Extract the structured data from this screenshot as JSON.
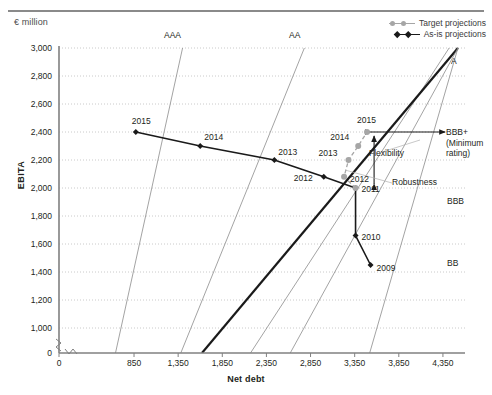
{
  "header": {
    "unit_label": "€ million"
  },
  "legend": {
    "position": "top-right",
    "entries": [
      {
        "label": "Target projections",
        "color": "#a6a6a6",
        "marker": "circle"
      },
      {
        "label": "As-is projections",
        "color": "#1a1a1a",
        "marker": "diamond"
      }
    ]
  },
  "chart_data": {
    "type": "line",
    "title": "",
    "subtitle": "",
    "xlabel": "Net debt",
    "ylabel": "EBITA",
    "unit": "€ million",
    "xlim": [
      0,
      4600
    ],
    "ylim": [
      0,
      3000
    ],
    "y_axis_break": true,
    "y_break_between": [
      0,
      1000
    ],
    "grid": true,
    "grid_style": "dotted-horizontal",
    "xticks": [
      0,
      850,
      1350,
      1850,
      2350,
      2850,
      3350,
      3850,
      4350
    ],
    "xtick_labels": [
      "0",
      "850",
      "1,350",
      "1,850",
      "2,350",
      "2,850",
      "3,350",
      "3,850",
      "4,350"
    ],
    "yticks": [
      0,
      1000,
      1200,
      1400,
      1600,
      1800,
      2000,
      2200,
      2400,
      2600,
      2800,
      3000
    ],
    "ytick_labels": [
      "0",
      "1,000",
      "1,200",
      "1,400",
      "1,600",
      "1,800",
      "2,000",
      "2,200",
      "2,400",
      "2,600",
      "2,800",
      "3,000"
    ],
    "series": [
      {
        "name": "As-is projections",
        "marker": "diamond",
        "color": "#1a1a1a",
        "style": "solid",
        "points": [
          {
            "label": "2009",
            "x": 3530,
            "y": 1450
          },
          {
            "label": "2010",
            "x": 3360,
            "y": 1660
          },
          {
            "label": "2011",
            "x": 3360,
            "y": 2000
          },
          {
            "label": "2012",
            "x": 3000,
            "y": 2080
          },
          {
            "label": "2013",
            "x": 2440,
            "y": 2200
          },
          {
            "label": "2014",
            "x": 1600,
            "y": 2300
          },
          {
            "label": "2015",
            "x": 870,
            "y": 2400
          }
        ]
      },
      {
        "name": "Target projections",
        "marker": "circle",
        "color": "#a6a6a6",
        "style": "dashed",
        "points": [
          {
            "label": "2011",
            "x": 3360,
            "y": 2000
          },
          {
            "label": "2012",
            "x": 3230,
            "y": 2080
          },
          {
            "label": "2013",
            "x": 3280,
            "y": 2200
          },
          {
            "label": "2014",
            "x": 3390,
            "y": 2300
          },
          {
            "label": "2015",
            "x": 3490,
            "y": 2400
          }
        ]
      }
    ],
    "rating_lines": [
      {
        "label": "AAA",
        "label_pos": "top",
        "color": "#8c8c8c",
        "weight": "normal",
        "x_at_ymin": 640,
        "x_at_ymax": 1400
      },
      {
        "label": "AA",
        "label_pos": "top",
        "color": "#8c8c8c",
        "weight": "normal",
        "x_at_ymin": 1380,
        "x_at_ymax": 2780
      },
      {
        "label": "A",
        "label_pos": "right",
        "color": "#8c8c8c",
        "weight": "normal",
        "x_at_ymin": 2170,
        "x_at_ymax": 4420
      },
      {
        "label": "BBB+",
        "sublabel": "(Minimum rating)",
        "label_pos": "right",
        "color": "#1a1a1a",
        "weight": "bold",
        "x_at_ymin": 1620,
        "x_at_ymax": 4520
      },
      {
        "label": "BBB",
        "label_pos": "right",
        "color": "#8c8c8c",
        "weight": "normal",
        "x_at_ymin": 2620,
        "x_at_ymax": 4520
      },
      {
        "label": "BB",
        "label_pos": "right",
        "color": "#8c8c8c",
        "weight": "normal",
        "x_at_ymin": 3520,
        "x_at_ymax": 4520
      }
    ],
    "annotations": [
      {
        "label": "Flexibility",
        "type": "horizontal-double-arrow",
        "y": 2400,
        "x_from": 3490,
        "x_to": 4420
      },
      {
        "label": "Robustness",
        "type": "vertical-double-arrow",
        "x": 3570,
        "y_from": 2000,
        "y_to": 2400
      }
    ]
  }
}
